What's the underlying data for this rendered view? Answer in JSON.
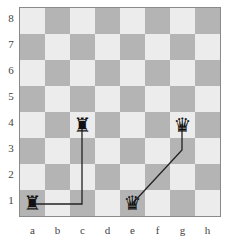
{
  "board": {
    "files": [
      "a",
      "b",
      "c",
      "d",
      "e",
      "f",
      "g",
      "h"
    ],
    "ranks": [
      "8",
      "7",
      "6",
      "5",
      "4",
      "3",
      "2",
      "1"
    ],
    "light_color": "#ececec",
    "dark_color": "#b4b4b4"
  },
  "pieces": [
    {
      "square": "a1",
      "type": "rook",
      "color": "black",
      "glyph": "♜"
    },
    {
      "square": "c4",
      "type": "rook",
      "color": "black",
      "glyph": "♜"
    },
    {
      "square": "e1",
      "type": "queen",
      "color": "black",
      "glyph": "♛"
    },
    {
      "square": "g4",
      "type": "queen",
      "color": "black",
      "glyph": "♛"
    }
  ],
  "paths": [
    {
      "piece": "rook",
      "from": "a1",
      "via": "c1",
      "to": "c4"
    },
    {
      "piece": "queen",
      "from": "e1",
      "via": "g3",
      "to": "g4"
    }
  ]
}
